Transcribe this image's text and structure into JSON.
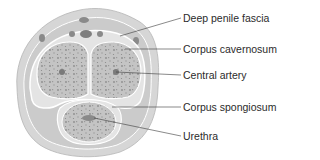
{
  "figure": {
    "colors": {
      "skin_outer": "#d6d6d6",
      "skin_band": "#c8c8c8",
      "tissue": "#bdbdbd",
      "fascia_line": "#ffffff",
      "vessel": "#8a8a8a",
      "line": "#3a3a3a",
      "text": "#2b2b2b"
    },
    "labels": [
      {
        "id": "deep-penile-fascia",
        "text": "Deep penile fascia",
        "y": 12
      },
      {
        "id": "corpus-cavernosum",
        "text": "Corpus cavernosum",
        "y": 43
      },
      {
        "id": "central-artery",
        "text": "Central artery",
        "y": 69
      },
      {
        "id": "corpus-spongiosum",
        "text": "Corpus spongiosum",
        "y": 101
      },
      {
        "id": "urethra",
        "text": "Urethra",
        "y": 130
      }
    ]
  }
}
